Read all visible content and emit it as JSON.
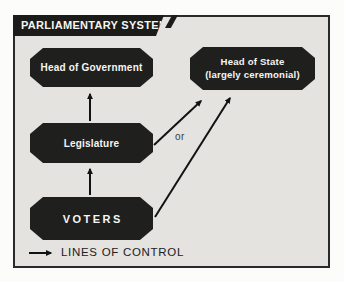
{
  "panel": {
    "title": "PARLIAMENTARY SYSTEMS"
  },
  "nodes": {
    "head_of_government": {
      "label": "Head of Government"
    },
    "head_of_state": {
      "line1": "Head of State",
      "line2": "(largely ceremonial)"
    },
    "legislature": {
      "label": "Legislature"
    },
    "voters": {
      "label": "VOTERS"
    }
  },
  "connector_label": "or",
  "legend": {
    "label": "LINES OF CONTROL"
  },
  "colors": {
    "panel_bg": "#e4e3e0",
    "frame_border": "#2a2a28",
    "title_bg": "#1b1b19",
    "node_fill": "#1f1f1e",
    "text_light": "#f6f5f3",
    "arrow": "#121212",
    "muted_text": "#3c3c3a",
    "legend_text": "#20201e"
  }
}
